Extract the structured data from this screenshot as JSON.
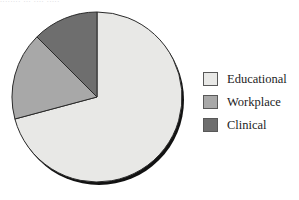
{
  "figure": {
    "background": "#ffffff",
    "cropped_text_bleed": "........ ... .... ....."
  },
  "chart_data": {
    "type": "pie",
    "title": "",
    "subtitle": "",
    "xlabel": "",
    "ylabel": "",
    "grid": false,
    "legend_position": "right",
    "start_angle_deg": 0,
    "direction": "clockwise",
    "categories": [
      "Educational",
      "Workplace",
      "Clinical"
    ],
    "values": [
      70.8,
      16.7,
      12.5
    ],
    "value_unit": "percent",
    "angles_deg": [
      255,
      60,
      45
    ],
    "colors": [
      "#e8e8e6",
      "#a8a8a8",
      "#6e6e6e"
    ],
    "slice_border_color": "#2a2a2a",
    "has_drop_shadow": true,
    "shadow_color": "#121212",
    "slices": [
      {
        "label": "Educational",
        "value": 70.8,
        "angle_deg": 255,
        "start_deg": 0,
        "end_deg": 255,
        "color": "#e8e8e6"
      },
      {
        "label": "Workplace",
        "value": 16.7,
        "angle_deg": 60,
        "start_deg": 255,
        "end_deg": 315,
        "color": "#a8a8a8"
      },
      {
        "label": "Clinical",
        "value": 12.5,
        "angle_deg": 45,
        "start_deg": 315,
        "end_deg": 360,
        "color": "#6e6e6e"
      }
    ]
  },
  "legend": {
    "items": [
      {
        "label": "Educational",
        "color": "#e8e8e6"
      },
      {
        "label": "Workplace",
        "color": "#a8a8a8"
      },
      {
        "label": "Clinical",
        "color": "#6e6e6e"
      }
    ]
  }
}
